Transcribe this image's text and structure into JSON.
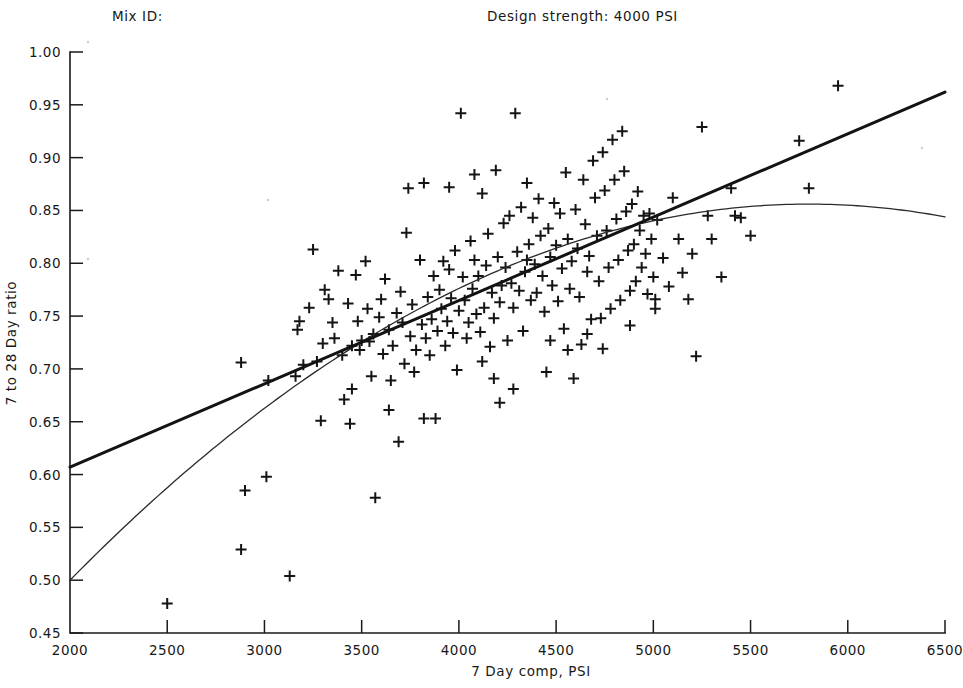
{
  "header": {
    "mix_id_label": "Mix ID:",
    "design_strength_label": "Design strength: 4000 PSI"
  },
  "chart_data": {
    "type": "scatter",
    "title": "",
    "xlabel": "7 Day comp, PSI",
    "ylabel": "7 to 28 Day ratio",
    "xlim": [
      2000,
      6500
    ],
    "ylim": [
      0.45,
      1.0
    ],
    "xticks": [
      2000,
      2500,
      3000,
      3500,
      4000,
      4500,
      5000,
      5500,
      6000,
      6500
    ],
    "xticklabels": [
      "2000",
      "2500",
      "3000",
      "3500",
      "4000",
      "4500",
      "5000",
      "5500",
      "6000",
      "6500"
    ],
    "yticks": [
      0.45,
      0.5,
      0.55,
      0.6,
      0.65,
      0.7,
      0.75,
      0.8,
      0.85,
      0.9,
      0.95,
      1.0
    ],
    "yticklabels": [
      "0.45",
      "0.50",
      "0.55",
      "0.60",
      "0.65",
      "0.70",
      "0.75",
      "0.80",
      "0.85",
      "0.90",
      "0.95",
      "1.00"
    ],
    "grid": false,
    "legend": "none",
    "marker": "plus",
    "marker_size": 11,
    "points": [
      [
        2500,
        0.478
      ],
      [
        2880,
        0.706
      ],
      [
        2900,
        0.585
      ],
      [
        2880,
        0.529
      ],
      [
        3010,
        0.598
      ],
      [
        3020,
        0.689
      ],
      [
        3130,
        0.504
      ],
      [
        3160,
        0.693
      ],
      [
        3200,
        0.704
      ],
      [
        3180,
        0.745
      ],
      [
        3170,
        0.737
      ],
      [
        3230,
        0.758
      ],
      [
        3250,
        0.813
      ],
      [
        3270,
        0.707
      ],
      [
        3290,
        0.651
      ],
      [
        3300,
        0.724
      ],
      [
        3310,
        0.775
      ],
      [
        3330,
        0.766
      ],
      [
        3350,
        0.744
      ],
      [
        3360,
        0.729
      ],
      [
        3380,
        0.793
      ],
      [
        3400,
        0.713
      ],
      [
        3410,
        0.671
      ],
      [
        3430,
        0.762
      ],
      [
        3450,
        0.722
      ],
      [
        3440,
        0.648
      ],
      [
        3470,
        0.789
      ],
      [
        3480,
        0.745
      ],
      [
        3490,
        0.718
      ],
      [
        3500,
        0.727
      ],
      [
        3520,
        0.802
      ],
      [
        3530,
        0.757
      ],
      [
        3540,
        0.726
      ],
      [
        3550,
        0.693
      ],
      [
        3560,
        0.733
      ],
      [
        3570,
        0.578
      ],
      [
        3590,
        0.749
      ],
      [
        3600,
        0.766
      ],
      [
        3610,
        0.714
      ],
      [
        3620,
        0.785
      ],
      [
        3640,
        0.737
      ],
      [
        3650,
        0.689
      ],
      [
        3660,
        0.722
      ],
      [
        3680,
        0.753
      ],
      [
        3690,
        0.631
      ],
      [
        3700,
        0.773
      ],
      [
        3710,
        0.744
      ],
      [
        3720,
        0.705
      ],
      [
        3730,
        0.829
      ],
      [
        3740,
        0.871
      ],
      [
        3750,
        0.731
      ],
      [
        3760,
        0.761
      ],
      [
        3770,
        0.697
      ],
      [
        3780,
        0.718
      ],
      [
        3800,
        0.803
      ],
      [
        3810,
        0.742
      ],
      [
        3820,
        0.876
      ],
      [
        3830,
        0.729
      ],
      [
        3840,
        0.768
      ],
      [
        3850,
        0.713
      ],
      [
        3860,
        0.747
      ],
      [
        3870,
        0.788
      ],
      [
        3880,
        0.653
      ],
      [
        3890,
        0.736
      ],
      [
        3900,
        0.775
      ],
      [
        3910,
        0.757
      ],
      [
        3920,
        0.802
      ],
      [
        3930,
        0.722
      ],
      [
        3940,
        0.745
      ],
      [
        3950,
        0.794
      ],
      [
        3960,
        0.767
      ],
      [
        3970,
        0.734
      ],
      [
        3980,
        0.812
      ],
      [
        3990,
        0.699
      ],
      [
        4000,
        0.755
      ],
      [
        4010,
        0.942
      ],
      [
        4020,
        0.787
      ],
      [
        4030,
        0.765
      ],
      [
        4040,
        0.729
      ],
      [
        4050,
        0.744
      ],
      [
        4060,
        0.821
      ],
      [
        4070,
        0.776
      ],
      [
        4080,
        0.803
      ],
      [
        4090,
        0.752
      ],
      [
        4100,
        0.788
      ],
      [
        4110,
        0.735
      ],
      [
        4120,
        0.866
      ],
      [
        4130,
        0.758
      ],
      [
        4140,
        0.798
      ],
      [
        4150,
        0.828
      ],
      [
        4160,
        0.721
      ],
      [
        4170,
        0.772
      ],
      [
        4180,
        0.748
      ],
      [
        4190,
        0.888
      ],
      [
        4200,
        0.806
      ],
      [
        4210,
        0.763
      ],
      [
        4220,
        0.779
      ],
      [
        4230,
        0.838
      ],
      [
        4240,
        0.796
      ],
      [
        4250,
        0.727
      ],
      [
        4260,
        0.845
      ],
      [
        4270,
        0.781
      ],
      [
        4280,
        0.758
      ],
      [
        4290,
        0.942
      ],
      [
        4300,
        0.811
      ],
      [
        4310,
        0.774
      ],
      [
        4320,
        0.853
      ],
      [
        4330,
        0.736
      ],
      [
        4340,
        0.792
      ],
      [
        4350,
        0.876
      ],
      [
        4360,
        0.818
      ],
      [
        4370,
        0.765
      ],
      [
        4380,
        0.843
      ],
      [
        4390,
        0.799
      ],
      [
        4400,
        0.772
      ],
      [
        4410,
        0.861
      ],
      [
        4420,
        0.826
      ],
      [
        4430,
        0.788
      ],
      [
        4440,
        0.754
      ],
      [
        4450,
        0.697
      ],
      [
        4460,
        0.833
      ],
      [
        4470,
        0.806
      ],
      [
        4480,
        0.779
      ],
      [
        4490,
        0.857
      ],
      [
        4500,
        0.817
      ],
      [
        4510,
        0.764
      ],
      [
        4520,
        0.847
      ],
      [
        4530,
        0.795
      ],
      [
        4540,
        0.738
      ],
      [
        4550,
        0.886
      ],
      [
        4560,
        0.823
      ],
      [
        4570,
        0.776
      ],
      [
        4580,
        0.802
      ],
      [
        4590,
        0.691
      ],
      [
        4600,
        0.851
      ],
      [
        4610,
        0.814
      ],
      [
        4620,
        0.768
      ],
      [
        4630,
        0.723
      ],
      [
        4640,
        0.879
      ],
      [
        4650,
        0.837
      ],
      [
        4660,
        0.792
      ],
      [
        4670,
        0.807
      ],
      [
        4680,
        0.747
      ],
      [
        4690,
        0.897
      ],
      [
        4700,
        0.862
      ],
      [
        4710,
        0.826
      ],
      [
        4720,
        0.783
      ],
      [
        4730,
        0.748
      ],
      [
        4740,
        0.905
      ],
      [
        4750,
        0.869
      ],
      [
        4760,
        0.831
      ],
      [
        4770,
        0.796
      ],
      [
        4780,
        0.757
      ],
      [
        4790,
        0.917
      ],
      [
        4800,
        0.879
      ],
      [
        4810,
        0.842
      ],
      [
        4820,
        0.803
      ],
      [
        4830,
        0.765
      ],
      [
        4840,
        0.925
      ],
      [
        4850,
        0.887
      ],
      [
        4860,
        0.849
      ],
      [
        4870,
        0.812
      ],
      [
        4880,
        0.774
      ],
      [
        4890,
        0.856
      ],
      [
        4900,
        0.818
      ],
      [
        4910,
        0.783
      ],
      [
        4920,
        0.868
      ],
      [
        4930,
        0.831
      ],
      [
        4940,
        0.796
      ],
      [
        4950,
        0.845
      ],
      [
        4960,
        0.809
      ],
      [
        4970,
        0.771
      ],
      [
        4980,
        0.847
      ],
      [
        4990,
        0.823
      ],
      [
        5000,
        0.787
      ],
      [
        5010,
        0.766
      ],
      [
        5020,
        0.841
      ],
      [
        5050,
        0.805
      ],
      [
        5080,
        0.778
      ],
      [
        5100,
        0.862
      ],
      [
        5130,
        0.823
      ],
      [
        5150,
        0.791
      ],
      [
        5180,
        0.766
      ],
      [
        5200,
        0.809
      ],
      [
        5220,
        0.712
      ],
      [
        5250,
        0.929
      ],
      [
        5280,
        0.845
      ],
      [
        5300,
        0.823
      ],
      [
        5350,
        0.787
      ],
      [
        5400,
        0.871
      ],
      [
        5420,
        0.845
      ],
      [
        5450,
        0.843
      ],
      [
        5500,
        0.826
      ],
      [
        5750,
        0.916
      ],
      [
        5800,
        0.871
      ],
      [
        5950,
        0.968
      ],
      [
        3950,
        0.872
      ],
      [
        4080,
        0.884
      ],
      [
        4350,
        0.803
      ],
      [
        4180,
        0.691
      ],
      [
        4210,
        0.668
      ],
      [
        3820,
        0.653
      ],
      [
        4560,
        0.718
      ],
      [
        4470,
        0.727
      ],
      [
        4880,
        0.741
      ],
      [
        5010,
        0.757
      ],
      [
        3450,
        0.681
      ],
      [
        3640,
        0.661
      ],
      [
        4120,
        0.707
      ],
      [
        4660,
        0.733
      ],
      [
        4740,
        0.719
      ],
      [
        4280,
        0.681
      ]
    ],
    "series": [
      {
        "name": "linear-fit",
        "type": "line",
        "style": "thick",
        "endpoints": [
          [
            2000,
            0.607
          ],
          [
            6500,
            0.962
          ]
        ]
      },
      {
        "name": "quadratic-fit",
        "type": "line",
        "style": "thin",
        "start": [
          2000,
          0.5
        ],
        "peak": [
          5800,
          0.856
        ],
        "end": [
          6500,
          0.849
        ]
      }
    ]
  }
}
